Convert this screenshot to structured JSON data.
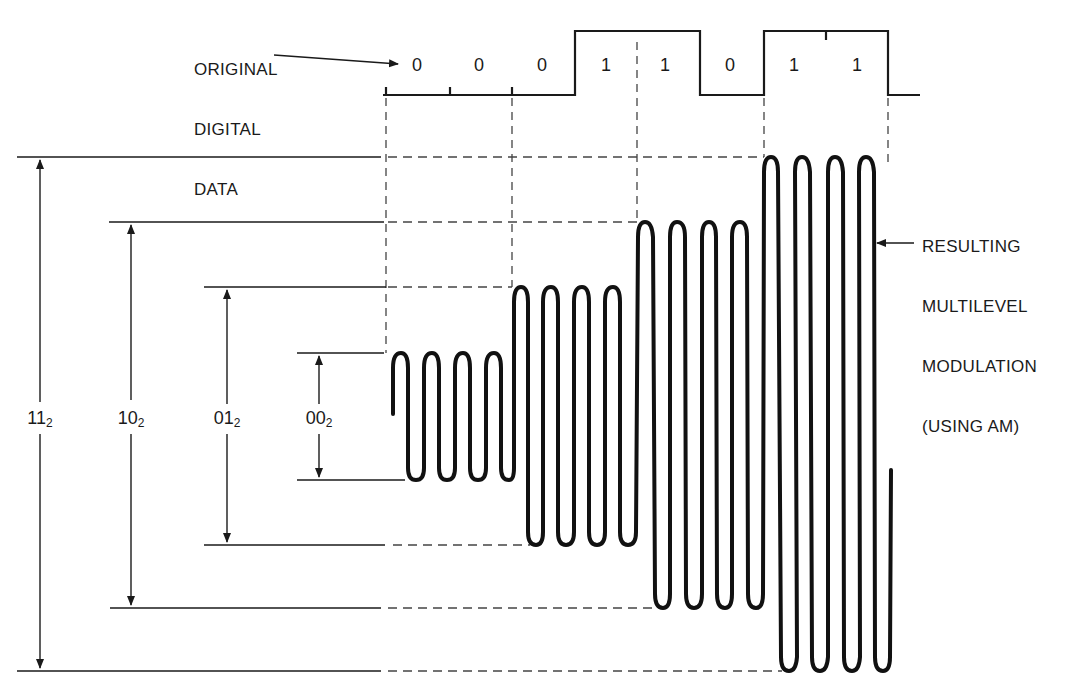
{
  "labels": {
    "original_data": [
      "ORIGINAL",
      "DIGITAL",
      "DATA"
    ],
    "resulting": [
      "RESULTING",
      "MULTILEVEL",
      "MODULATION",
      "(USING AM)"
    ]
  },
  "bits": [
    "0",
    "0",
    "0",
    "1",
    "1",
    "0",
    "1",
    "1"
  ],
  "levels": [
    {
      "code": "11",
      "base": "2"
    },
    {
      "code": "10",
      "base": "2"
    },
    {
      "code": "01",
      "base": "2"
    },
    {
      "code": "00",
      "base": "2"
    }
  ],
  "symbols": [
    "00",
    "01",
    "10",
    "11"
  ],
  "colors": {
    "ink": "#1a1a1a",
    "dash": "#444444",
    "background": "#ffffff"
  }
}
